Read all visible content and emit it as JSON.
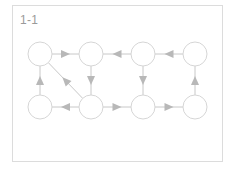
{
  "title": "1-1",
  "colors": {
    "node_stroke": "#d6d6d6",
    "edge": "#c8c8c8",
    "arrow": "#b8b8b8",
    "frame": "#dcdcdc",
    "label": "#9a9a9a"
  },
  "nodes": [
    {
      "id": "n1",
      "row": 0,
      "col": 0,
      "cx": 40,
      "cy": 54
    },
    {
      "id": "n2",
      "row": 0,
      "col": 1,
      "cx": 91,
      "cy": 54
    },
    {
      "id": "n3",
      "row": 0,
      "col": 2,
      "cx": 143,
      "cy": 54
    },
    {
      "id": "n4",
      "row": 0,
      "col": 3,
      "cx": 195,
      "cy": 54
    },
    {
      "id": "n5",
      "row": 1,
      "col": 0,
      "cx": 40,
      "cy": 107
    },
    {
      "id": "n6",
      "row": 1,
      "col": 1,
      "cx": 91,
      "cy": 107
    },
    {
      "id": "n7",
      "row": 1,
      "col": 2,
      "cx": 143,
      "cy": 107
    },
    {
      "id": "n8",
      "row": 1,
      "col": 3,
      "cx": 195,
      "cy": 107
    }
  ],
  "edges": [
    {
      "from": "n1",
      "to": "n2"
    },
    {
      "from": "n3",
      "to": "n2"
    },
    {
      "from": "n4",
      "to": "n3"
    },
    {
      "from": "n2",
      "to": "n6"
    },
    {
      "from": "n3",
      "to": "n7"
    },
    {
      "from": "n5",
      "to": "n1"
    },
    {
      "from": "n6",
      "to": "n1"
    },
    {
      "from": "n6",
      "to": "n5"
    },
    {
      "from": "n6",
      "to": "n7"
    },
    {
      "from": "n7",
      "to": "n8"
    },
    {
      "from": "n8",
      "to": "n4"
    }
  ],
  "node_radius": 12
}
